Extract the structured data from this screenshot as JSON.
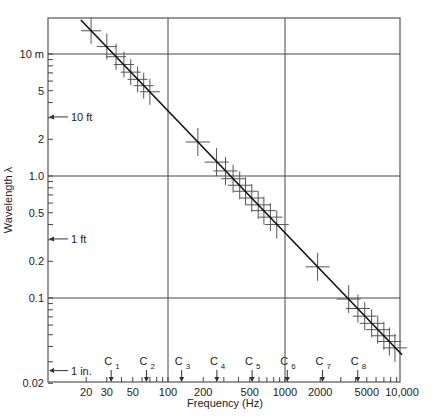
{
  "chart_data": {
    "type": "scatter",
    "title": "",
    "xlabel": "Frequency (Hz)",
    "ylabel": "Wavelength λ",
    "xscale": "log",
    "yscale": "log",
    "xlim": [
      10,
      10000
    ],
    "ylim": [
      0.02,
      20
    ],
    "grid": true,
    "x_ticks": [
      20,
      30,
      50,
      100,
      200,
      500,
      1000,
      2000,
      5000,
      10000
    ],
    "x_tick_labels": [
      "20",
      "30",
      "50",
      "100",
      "200",
      "500",
      "1000",
      "2000",
      "5000",
      "10,000"
    ],
    "y_ticks": [
      10,
      5,
      2,
      1.0,
      0.5,
      0.2,
      0.1,
      0.02
    ],
    "y_tick_labels": [
      "10 m",
      "5",
      "2",
      "1.0",
      "0.5",
      "0.2",
      "0.1",
      "0.02"
    ],
    "gridlines_x": [
      100,
      1000
    ],
    "gridlines_y": [
      10,
      1.0,
      0.1
    ],
    "reference_markers_y": [
      {
        "label": "10 ft",
        "value": 3.05
      },
      {
        "label": "1 ft",
        "value": 0.305
      },
      {
        "label": "1 in.",
        "value": 0.0254
      }
    ],
    "note_markers_x": [
      {
        "label": "C",
        "sub": "1",
        "value": 32.7
      },
      {
        "label": "C",
        "sub": "2",
        "value": 65.4
      },
      {
        "label": "C",
        "sub": "3",
        "value": 130.8
      },
      {
        "label": "C",
        "sub": "4",
        "value": 261.6
      },
      {
        "label": "C",
        "sub": "5",
        "value": 523.3
      },
      {
        "label": "C",
        "sub": "6",
        "value": 1046.5
      },
      {
        "label": "C",
        "sub": "7",
        "value": 2093
      },
      {
        "label": "C",
        "sub": "8",
        "value": 4186
      }
    ],
    "fit_line": {
      "description": "λ = 343 / f",
      "x": [
        18,
        10000
      ],
      "y": [
        19,
        0.0343
      ]
    },
    "series": [
      {
        "name": "measurements (crosses)",
        "x": [
          22,
          30,
          36,
          42,
          48,
          55,
          62,
          70,
          180,
          260,
          310,
          360,
          410,
          460,
          520,
          590,
          660,
          750,
          850,
          1900,
          3500,
          4200,
          4800,
          5500,
          6200,
          7000,
          7800,
          8700
        ],
        "y": [
          15.5,
          11.5,
          9.5,
          8.2,
          7.1,
          6.2,
          5.5,
          4.9,
          1.9,
          1.3,
          1.1,
          0.95,
          0.84,
          0.75,
          0.66,
          0.58,
          0.52,
          0.46,
          0.4,
          0.18,
          0.098,
          0.082,
          0.071,
          0.062,
          0.055,
          0.049,
          0.044,
          0.039
        ]
      }
    ]
  }
}
